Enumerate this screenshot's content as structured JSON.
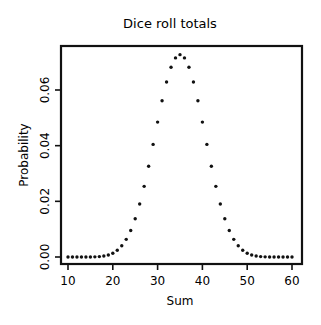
{
  "chart_data": {
    "type": "scatter",
    "title": "Dice roll totals",
    "xlabel": "Sum",
    "ylabel": "Probability",
    "xlim": [
      8.5,
      61.5
    ],
    "ylim": [
      -0.0015,
      0.0755
    ],
    "xticks": [
      10,
      20,
      30,
      40,
      50,
      60
    ],
    "xtick_labels": [
      "10",
      "20",
      "30",
      "40",
      "50",
      "60"
    ],
    "yticks": [
      0.0,
      0.02,
      0.04,
      0.06
    ],
    "ytick_labels": [
      "0.00",
      "0.02",
      "0.04",
      "0.06"
    ],
    "grid": false,
    "legend": null,
    "x": [
      10,
      11,
      12,
      13,
      14,
      15,
      16,
      17,
      18,
      19,
      20,
      21,
      22,
      23,
      24,
      25,
      26,
      27,
      28,
      29,
      30,
      31,
      32,
      33,
      34,
      35,
      36,
      37,
      38,
      39,
      40,
      41,
      42,
      43,
      44,
      45,
      46,
      47,
      48,
      49,
      50,
      51,
      52,
      53,
      54,
      55,
      56,
      57,
      58,
      59,
      60
    ],
    "values": [
      0.0,
      2e-07,
      9e-07,
      3.6e-06,
      3.6e-06,
      1.66e-05,
      5.37e-05,
      0.0001428,
      0.0003349,
      0.0007049,
      0.0013549,
      0.0024104,
      0.0040203,
      0.0063418,
      0.0095353,
      0.0137466,
      0.0190416,
      0.0253867,
      0.0326235,
      0.0404564,
      0.0484644,
      0.0561239,
      0.0628699,
      0.0681575,
      0.0715322,
      0.0726929,
      0.0715322,
      0.0681575,
      0.0628699,
      0.0561239,
      0.0484644,
      0.0404564,
      0.0326235,
      0.0253867,
      0.0190416,
      0.0137466,
      0.0095353,
      0.0063418,
      0.0040203,
      0.0024104,
      0.0013549,
      0.0007049,
      0.0003349,
      0.0001428,
      5.37e-05,
      1.66e-05,
      3.6e-06,
      3.6e-06,
      9e-07,
      2e-07,
      0.0
    ],
    "marker": "dot",
    "marker_color": "#111111"
  }
}
